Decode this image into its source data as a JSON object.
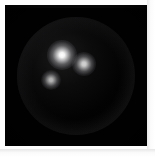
{
  "figure": {
    "frame": {
      "border_color": "#fdfdfd",
      "border_width_px": 5,
      "canvas_color": "#010101",
      "canvas_width_px": 142,
      "canvas_height_px": 141
    },
    "sphere": {
      "label": "sphere",
      "center_x_px": 71,
      "center_y_px": 71,
      "radius_px": 59,
      "body_color": "#050506",
      "rim_color": "#787880",
      "rim_label": "limb brightening"
    },
    "highlights": [
      {
        "label": "specular-highlight-1",
        "center_x_px": 57,
        "center_y_px": 50,
        "radius_px": 15,
        "color": "#ffffff",
        "intensity": 1.0
      },
      {
        "label": "specular-highlight-2",
        "center_x_px": 79,
        "center_y_px": 59,
        "radius_px": 12,
        "color": "#f2f2f2",
        "intensity": 0.82
      },
      {
        "label": "specular-highlight-3",
        "center_x_px": 46,
        "center_y_px": 75,
        "radius_px": 10,
        "color": "#e6e6e6",
        "intensity": 0.7
      }
    ]
  }
}
